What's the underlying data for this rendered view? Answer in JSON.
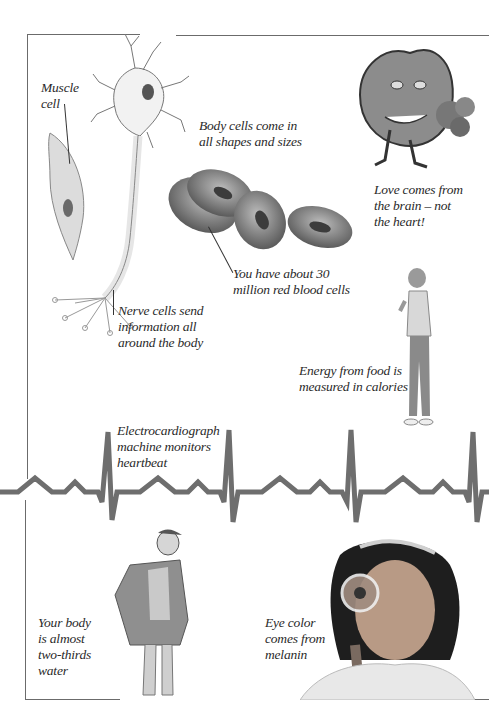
{
  "page": {
    "background": "#ffffff",
    "frame_color": "#6b6b6b",
    "ecg_color": "#6e6e6e"
  },
  "captions": {
    "muscle_cell": "Muscle\ncell",
    "body_cells": "Body cells come in\nall shapes and sizes",
    "love": "Love comes from\nthe brain – not\nthe heart!",
    "red_blood_cells": "You have about 30\nmillion red blood cells",
    "nerve_cells": "Nerve cells send\ninformation all\naround the body",
    "energy": "Energy from food is\nmeasured in calories",
    "ecg": "Electrocardiograph\nmachine monitors\nheartbeat",
    "water": "Your body\nis almost\ntwo-thirds\nwater",
    "eye_color": "Eye color\ncomes from\nmelanin"
  },
  "illustrations": [
    {
      "name": "nerve-cell",
      "label": "Nerve cell illustration"
    },
    {
      "name": "muscle-cell",
      "label": "Muscle cell illustration"
    },
    {
      "name": "red-blood-cells",
      "label": "Red blood cells illustration"
    },
    {
      "name": "cartoon-heart",
      "label": "Cartoon heart holding flowers"
    },
    {
      "name": "boy-eating",
      "label": "Boy eating a banana"
    },
    {
      "name": "ecg-trace",
      "label": "Heartbeat trace"
    },
    {
      "name": "man-in-robe",
      "label": "Man in robe showing water inside body"
    },
    {
      "name": "girl-magnifier",
      "label": "Girl with magnifying glass"
    }
  ]
}
